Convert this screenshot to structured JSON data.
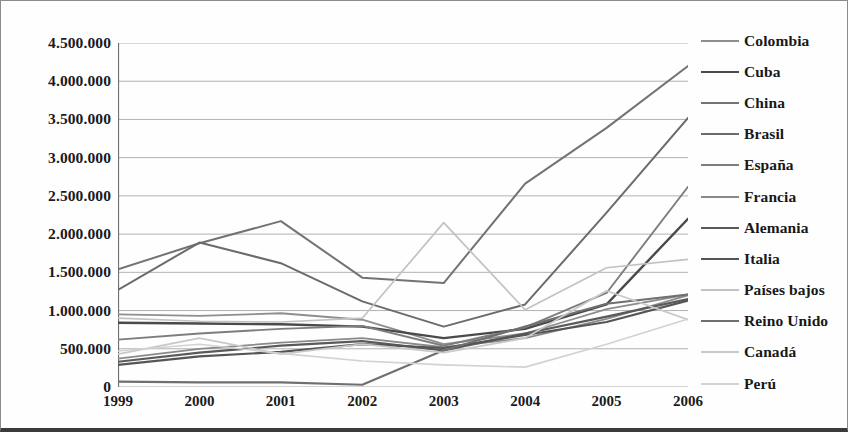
{
  "chart_data": {
    "type": "line",
    "title": "",
    "xlabel": "",
    "ylabel": "",
    "grid": true,
    "legend_position": "right",
    "x": [
      "1999",
      "2000",
      "2001",
      "2002",
      "2003",
      "2004",
      "2005",
      "2006"
    ],
    "y_ticks": [
      "0",
      "500.000",
      "1.000.000",
      "1.500.000",
      "2.000.000",
      "2.500.000",
      "3.000.000",
      "3.500.000",
      "4.000.000",
      "4.500.000"
    ],
    "y_tick_values": [
      0,
      500000,
      1000000,
      1500000,
      2000000,
      2500000,
      3000000,
      3500000,
      4000000,
      4500000
    ],
    "ylim": [
      0,
      4500000
    ],
    "series": [
      {
        "name": "Colombia",
        "color": "#8e8e8e",
        "width": 1.8,
        "values": [
          950000,
          930000,
          965000,
          880000,
          560000,
          700000,
          1020000,
          1210000
        ]
      },
      {
        "name": "Cuba",
        "color": "#4a4a4a",
        "width": 2.4,
        "values": [
          840000,
          830000,
          820000,
          790000,
          640000,
          760000,
          1080000,
          2200000
        ]
      },
      {
        "name": "China",
        "color": "#737373",
        "width": 2.0,
        "values": [
          1540000,
          1880000,
          2170000,
          1430000,
          1360000,
          2660000,
          3390000,
          4200000
        ]
      },
      {
        "name": "Brasil",
        "color": "#6b6b6b",
        "width": 2.0,
        "values": [
          1270000,
          1890000,
          1620000,
          1120000,
          790000,
          1080000,
          2280000,
          3520000
        ]
      },
      {
        "name": "España",
        "color": "#7d7d7d",
        "width": 1.9,
        "values": [
          620000,
          700000,
          760000,
          800000,
          540000,
          780000,
          1230000,
          2620000
        ]
      },
      {
        "name": "Francia",
        "color": "#8a8a8a",
        "width": 1.8,
        "values": [
          370000,
          500000,
          580000,
          640000,
          520000,
          640000,
          890000,
          1200000
        ]
      },
      {
        "name": "Alemania",
        "color": "#5a5a5a",
        "width": 2.2,
        "values": [
          330000,
          450000,
          540000,
          600000,
          480000,
          700000,
          920000,
          1150000
        ]
      },
      {
        "name": "Italia",
        "color": "#555555",
        "width": 2.2,
        "values": [
          290000,
          400000,
          460000,
          560000,
          510000,
          680000,
          850000,
          1130000
        ]
      },
      {
        "name": "Países bajos",
        "color": "#c2c2c2",
        "width": 1.7,
        "values": [
          900000,
          860000,
          850000,
          900000,
          2150000,
          1010000,
          1560000,
          1670000
        ]
      },
      {
        "name": "Reino Unido",
        "color": "#6f6f6f",
        "width": 2.1,
        "values": [
          70000,
          60000,
          60000,
          30000,
          480000,
          790000,
          1090000,
          1210000
        ]
      },
      {
        "name": "Canadá",
        "color": "#c8c8c8",
        "width": 1.7,
        "values": [
          430000,
          640000,
          430000,
          560000,
          450000,
          640000,
          1260000,
          880000
        ]
      },
      {
        "name": "Perú",
        "color": "#d2d2d2",
        "width": 1.6,
        "values": [
          470000,
          560000,
          440000,
          340000,
          290000,
          260000,
          560000,
          890000
        ]
      }
    ]
  },
  "legend": {
    "items": [
      {
        "label": "Colombia"
      },
      {
        "label": "Cuba"
      },
      {
        "label": "China"
      },
      {
        "label": "Brasil"
      },
      {
        "label": "España"
      },
      {
        "label": "Francia"
      },
      {
        "label": "Alemania"
      },
      {
        "label": "Italia"
      },
      {
        "label": "Países bajos"
      },
      {
        "label": "Reino Unido"
      },
      {
        "label": "Canadá"
      },
      {
        "label": "Perú"
      }
    ]
  },
  "axis_colors": {
    "grid": "#a9a9a9",
    "axis": "#6e6e6e",
    "text": "#1b1b1b"
  }
}
